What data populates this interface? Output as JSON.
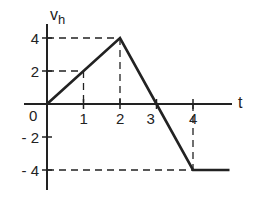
{
  "chart_data": {
    "type": "line",
    "title": "",
    "xlabel": "t",
    "ylabel": "v_h",
    "ylabel_main": "v",
    "ylabel_sub": "h",
    "x": [
      0,
      2,
      3,
      4,
      5
    ],
    "series": [
      {
        "name": "v_h",
        "values": [
          0,
          4,
          0,
          -4,
          -4
        ]
      }
    ],
    "x_ticks": [
      1,
      2,
      3,
      4
    ],
    "x_tick_labels": [
      "1",
      "2",
      "3",
      "4"
    ],
    "origin_label": "0",
    "y_ticks": [
      4,
      2,
      -2,
      -4
    ],
    "y_tick_labels": [
      "4",
      "2",
      "- 2",
      "- 4"
    ],
    "xlim": [
      0,
      5
    ],
    "ylim": [
      -4.5,
      4.8
    ],
    "guides": [
      {
        "from": [
          0,
          4
        ],
        "to": [
          2,
          4
        ]
      },
      {
        "from": [
          0,
          2
        ],
        "to": [
          1,
          2
        ]
      },
      {
        "from": [
          1,
          2
        ],
        "to": [
          1,
          0
        ]
      },
      {
        "from": [
          2,
          4
        ],
        "to": [
          2,
          0
        ]
      },
      {
        "from": [
          4,
          0
        ],
        "to": [
          4,
          -4
        ]
      },
      {
        "from": [
          0,
          -4
        ],
        "to": [
          4,
          -4
        ]
      }
    ],
    "grid": false,
    "legend": "none"
  },
  "colors": {
    "line": "#222222",
    "axis": "#222222",
    "background": "#ffffff"
  }
}
